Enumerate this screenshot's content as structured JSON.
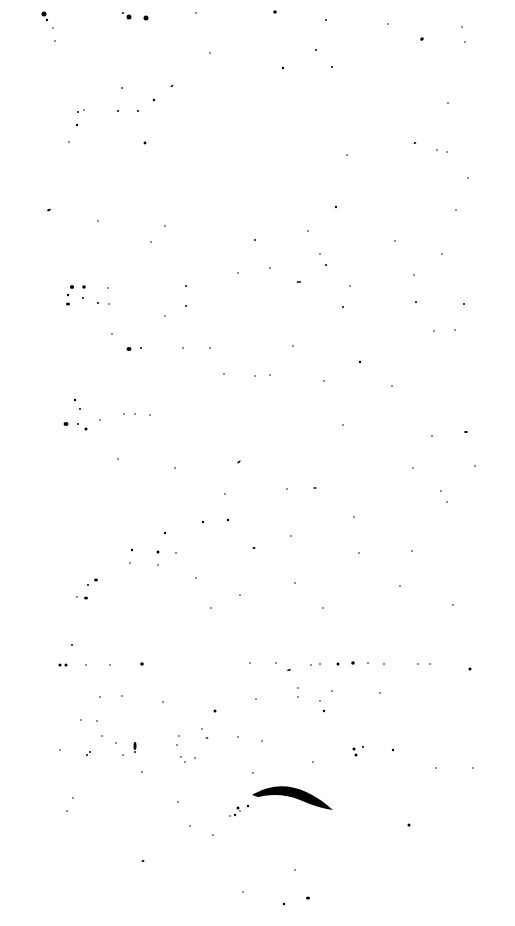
{
  "image": {
    "width": 515,
    "height": 926,
    "background": "#ffffff",
    "ink": "#000000",
    "description": "Speckle noise on white background"
  },
  "specks": [
    [
      44,
      14,
      2.5
    ],
    [
      47,
      20,
      1.2
    ],
    [
      129,
      17,
      2.5
    ],
    [
      146,
      18,
      2.5
    ],
    [
      123,
      13,
      1
    ],
    [
      196,
      13,
      0.8
    ],
    [
      275,
      12,
      1.8
    ],
    [
      326,
      20,
      1
    ],
    [
      388,
      24,
      0.8
    ],
    [
      462,
      27,
      0.8
    ],
    [
      55,
      41,
      0.8
    ],
    [
      53,
      28,
      0.8
    ],
    [
      422,
      39,
      2,
      1.5,
      -40
    ],
    [
      465,
      42,
      0.8
    ],
    [
      210,
      53,
      0.8
    ],
    [
      316,
      50,
      1.2,
      0.8,
      -30
    ],
    [
      332,
      67,
      1
    ],
    [
      283,
      68,
      1.2
    ],
    [
      122,
      88,
      1.2,
      0.8,
      0
    ],
    [
      172,
      86,
      1.5,
      0.8,
      -30
    ],
    [
      154,
      100,
      1.2
    ],
    [
      84,
      110,
      0.8
    ],
    [
      78,
      112,
      1
    ],
    [
      118,
      111,
      1
    ],
    [
      138,
      111,
      1
    ],
    [
      77,
      125,
      1.2
    ],
    [
      145,
      143,
      1.4
    ],
    [
      448,
      103,
      0.8
    ],
    [
      415,
      143,
      1.5,
      0.8,
      -30
    ],
    [
      437,
      150,
      0.8
    ],
    [
      447,
      152,
      0.8
    ],
    [
      347,
      155,
      0.8
    ],
    [
      69,
      142,
      0.8
    ],
    [
      468,
      178,
      0.8
    ],
    [
      49,
      210,
      2,
      1,
      -15
    ],
    [
      98,
      221,
      0.8
    ],
    [
      336,
      207,
      1.2
    ],
    [
      456,
      210,
      0.8
    ],
    [
      165,
      226,
      0.8
    ],
    [
      255,
      240,
      1
    ],
    [
      151,
      242,
      0.8
    ],
    [
      308,
      231,
      0.8
    ],
    [
      395,
      241,
      0.8
    ],
    [
      320,
      254,
      0.8
    ],
    [
      442,
      254,
      0.8
    ],
    [
      270,
      268,
      0.8
    ],
    [
      238,
      273,
      0.8
    ],
    [
      326,
      265,
      1
    ],
    [
      299,
      282,
      2.5,
      0.8,
      -5
    ],
    [
      350,
      286,
      0.8
    ],
    [
      414,
      275,
      0.8
    ],
    [
      186,
      286,
      1
    ],
    [
      72,
      287,
      2
    ],
    [
      84,
      287,
      1.8
    ],
    [
      68,
      295,
      1.2
    ],
    [
      83,
      298,
      1
    ],
    [
      108,
      288,
      0.8
    ],
    [
      68,
      304,
      2,
      1.5,
      0
    ],
    [
      98,
      303,
      1
    ],
    [
      109,
      304,
      0.8
    ],
    [
      186,
      306,
      1
    ],
    [
      343,
      307,
      1
    ],
    [
      416,
      302,
      1
    ],
    [
      464,
      304,
      1
    ],
    [
      165,
      316,
      0.8
    ],
    [
      434,
      331,
      0.8
    ],
    [
      455,
      330,
      0.8
    ],
    [
      129,
      349,
      2.5,
      2,
      0
    ],
    [
      141,
      348,
      1
    ],
    [
      112,
      334,
      0.8
    ],
    [
      183,
      348,
      0.8
    ],
    [
      210,
      348,
      0.8
    ],
    [
      293,
      346,
      0.8
    ],
    [
      360,
      362,
      1.2
    ],
    [
      224,
      374,
      0.8
    ],
    [
      255,
      376,
      0.8
    ],
    [
      270,
      375,
      0.8
    ],
    [
      324,
      381,
      0.8
    ],
    [
      392,
      386,
      0.8
    ],
    [
      75,
      400,
      1.2
    ],
    [
      80,
      409,
      1
    ],
    [
      66,
      424,
      2.5,
      2,
      0
    ],
    [
      78,
      424,
      1
    ],
    [
      86,
      429,
      1.5
    ],
    [
      124,
      414,
      0.8
    ],
    [
      135,
      414,
      0.8
    ],
    [
      150,
      415,
      0.8
    ],
    [
      100,
      420,
      0.8
    ],
    [
      343,
      425,
      0.8
    ],
    [
      432,
      436,
      0.8
    ],
    [
      466,
      432,
      2,
      1,
      0
    ],
    [
      239,
      462,
      2,
      0.8,
      -35
    ],
    [
      118,
      459,
      0.8
    ],
    [
      175,
      468,
      0.8
    ],
    [
      413,
      468,
      0.8
    ],
    [
      475,
      466,
      0.8
    ],
    [
      315,
      488,
      2,
      0.8,
      0
    ],
    [
      287,
      489,
      0.8
    ],
    [
      225,
      494,
      0.8
    ],
    [
      441,
      491,
      0.8
    ],
    [
      447,
      502,
      0.8
    ],
    [
      354,
      517,
      0.8
    ],
    [
      203,
      522,
      1.2
    ],
    [
      228,
      520,
      1.2
    ],
    [
      165,
      533,
      1.2
    ],
    [
      291,
      536,
      0.8
    ],
    [
      132,
      550,
      1.2
    ],
    [
      158,
      552,
      1.5
    ],
    [
      254,
      548,
      1.5,
      1,
      0
    ],
    [
      176,
      553,
      0.8
    ],
    [
      130,
      563,
      0.8
    ],
    [
      158,
      565,
      0.8
    ],
    [
      359,
      553,
      0.8
    ],
    [
      412,
      551,
      0.8
    ],
    [
      96,
      580,
      2,
      1.5,
      0
    ],
    [
      88,
      585,
      1
    ],
    [
      196,
      578,
      0.8
    ],
    [
      86,
      598,
      2,
      1.5,
      0
    ],
    [
      77,
      597,
      0.8
    ],
    [
      240,
      595,
      0.8
    ],
    [
      295,
      583,
      0.8
    ],
    [
      400,
      586,
      0.8
    ],
    [
      453,
      605,
      0.8
    ],
    [
      211,
      608,
      0.8
    ],
    [
      323,
      608,
      0.8
    ],
    [
      72,
      645,
      1
    ],
    [
      60,
      665,
      1.5
    ],
    [
      66,
      665,
      1.5
    ],
    [
      86,
      665,
      0.8
    ],
    [
      142,
      664,
      1.8
    ],
    [
      110,
      665,
      0.8
    ],
    [
      250,
      663,
      0.8
    ],
    [
      276,
      663,
      0.8
    ],
    [
      311,
      665,
      0.8
    ],
    [
      320,
      664,
      0.8
    ],
    [
      338,
      664,
      1.5
    ],
    [
      353,
      663,
      1.8
    ],
    [
      368,
      663,
      0.8
    ],
    [
      384,
      664,
      0.8
    ],
    [
      418,
      664,
      0.8
    ],
    [
      430,
      664,
      0.8
    ],
    [
      470,
      669,
      1.5
    ],
    [
      289,
      670,
      2,
      0.8,
      -10
    ],
    [
      100,
      697,
      0.8
    ],
    [
      122,
      696,
      0.8
    ],
    [
      163,
      702,
      0.8
    ],
    [
      215,
      711,
      1.5,
      1.5,
      0
    ],
    [
      256,
      699,
      0.8
    ],
    [
      298,
      688,
      0.8
    ],
    [
      298,
      697,
      0.8
    ],
    [
      320,
      701,
      0.8
    ],
    [
      324,
      711,
      1.2
    ],
    [
      332,
      691,
      0.8
    ],
    [
      380,
      693,
      0.8
    ],
    [
      81,
      720,
      0.8
    ],
    [
      97,
      721,
      0.8
    ],
    [
      102,
      736,
      0.8
    ],
    [
      202,
      729,
      0.8
    ],
    [
      179,
      736,
      0.8
    ],
    [
      207,
      738,
      1.5,
      0.8,
      0
    ],
    [
      238,
      737,
      0.8
    ],
    [
      116,
      743,
      0.8
    ],
    [
      135,
      746,
      1.5,
      4,
      0
    ],
    [
      177,
      745,
      0.8
    ],
    [
      135,
      752,
      1
    ],
    [
      262,
      741,
      0.8
    ],
    [
      354,
      749,
      1.5
    ],
    [
      363,
      747,
      1
    ],
    [
      356,
      755,
      1.5
    ],
    [
      393,
      750,
      1.2
    ],
    [
      60,
      750,
      0.8
    ],
    [
      90,
      752,
      1
    ],
    [
      87,
      755,
      1
    ],
    [
      123,
      755,
      0.8
    ],
    [
      181,
      757,
      0.8
    ],
    [
      195,
      758,
      0.8
    ],
    [
      142,
      772,
      0.8
    ],
    [
      185,
      762,
      0.8
    ],
    [
      253,
      773,
      0.8
    ],
    [
      313,
      762,
      0.8
    ],
    [
      436,
      768,
      0.8
    ],
    [
      473,
      768,
      0.8
    ],
    [
      73,
      798,
      0.8
    ],
    [
      178,
      802,
      0.8
    ],
    [
      409,
      825,
      1.5
    ],
    [
      67,
      811,
      0.8
    ],
    [
      143,
      861,
      1.5,
      1,
      0
    ],
    [
      190,
      826,
      0.8
    ],
    [
      213,
      835,
      0.8
    ],
    [
      243,
      892,
      0.8
    ],
    [
      284,
      904,
      1.2
    ],
    [
      308,
      898,
      2,
      1.5,
      0
    ],
    [
      295,
      870,
      0.8
    ],
    [
      235,
      815,
      1.2
    ],
    [
      238,
      808,
      1.5
    ],
    [
      248,
      806,
      1.2
    ],
    [
      240,
      811,
      0.8
    ],
    [
      230,
      816,
      0.8
    ]
  ],
  "arc": {
    "path": "M 252 795 Q 290 772 333 810 Q 318 808 300 800 Q 280 792 258 797 Z",
    "fill": "#000000"
  }
}
